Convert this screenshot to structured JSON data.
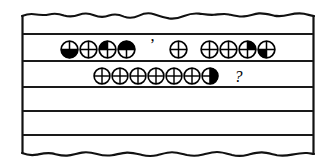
{
  "scene": {
    "name": "torn-ruled-paper-note",
    "description": "A torn sheet of ruled paper with two handwritten lines of circular cross-quadrant symbols",
    "paper_color": "#ffffff",
    "ink_color": "#000000",
    "rule_line_color": "#1a1a1a",
    "rule_line_count": 5,
    "torn_edges": [
      "top",
      "bottom"
    ]
  },
  "lines": [
    {
      "id": "line-1",
      "groups": [
        {
          "id": "line-1-word-1",
          "glyphs": [
            {
              "name": "circle-cross-bottom-half-filled",
              "fill": "bottom-half"
            },
            {
              "name": "circle-cross-empty",
              "fill": "none"
            },
            {
              "name": "circle-cross-upper-left-filled",
              "fill": "upper-left"
            },
            {
              "name": "circle-cross-top-half-filled",
              "fill": "top-half"
            }
          ]
        },
        {
          "id": "line-1-punct-1",
          "punctuation": "’",
          "punct_class": "apostrophe"
        },
        {
          "id": "line-1-word-2",
          "glyphs": [
            {
              "name": "circle-cross-empty",
              "fill": "none"
            }
          ]
        },
        {
          "id": "line-1-word-3",
          "glyphs": [
            {
              "name": "circle-cross-empty",
              "fill": "none"
            },
            {
              "name": "circle-cross-empty",
              "fill": "none"
            },
            {
              "name": "circle-cross-upper-right-filled",
              "fill": "upper-right"
            },
            {
              "name": "circle-cross-lower-left-filled",
              "fill": "lower-left"
            }
          ]
        }
      ]
    },
    {
      "id": "line-2",
      "groups": [
        {
          "id": "line-2-word-1",
          "glyphs": [
            {
              "name": "circle-cross-empty",
              "fill": "none"
            },
            {
              "name": "circle-cross-empty",
              "fill": "none"
            },
            {
              "name": "circle-cross-empty",
              "fill": "none"
            },
            {
              "name": "circle-cross-empty",
              "fill": "none"
            },
            {
              "name": "circle-cross-empty",
              "fill": "none"
            },
            {
              "name": "circle-cross-empty",
              "fill": "none"
            },
            {
              "name": "circle-cross-right-half-filled",
              "fill": "right-half"
            }
          ]
        },
        {
          "id": "line-2-punct-1",
          "punctuation": "?",
          "punct_class": "question"
        }
      ]
    }
  ]
}
